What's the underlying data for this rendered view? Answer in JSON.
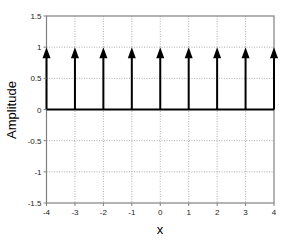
{
  "chart_data": {
    "type": "stem",
    "title": "",
    "xlabel": "x",
    "ylabel": "Amplitude",
    "xlim": [
      -4,
      4
    ],
    "ylim": [
      -1.5,
      1.5
    ],
    "x_ticks": [
      -4,
      -3,
      -2,
      -1,
      0,
      1,
      2,
      3,
      4
    ],
    "y_ticks": [
      -1.5,
      -1,
      -0.5,
      0,
      0.5,
      1,
      1.5
    ],
    "x_tick_labels": [
      "-4",
      "-3",
      "-2",
      "-1",
      "0",
      "1",
      "2",
      "3",
      "4"
    ],
    "y_tick_labels": [
      "-1.5",
      "-1",
      "-0.5",
      "0",
      "0.5",
      "1",
      "1.5"
    ],
    "grid": true,
    "grid_style": "dotted",
    "baseline": 0,
    "marker": "arrow-up",
    "series": [
      {
        "name": "impulse train",
        "x": [
          -4,
          -3,
          -2,
          -1,
          0,
          1,
          2,
          3,
          4
        ],
        "y": [
          1,
          1,
          1,
          1,
          1,
          1,
          1,
          1,
          1
        ]
      }
    ],
    "colors": {
      "stem": "#000000",
      "axis": "#808080",
      "grid": "#999999"
    }
  }
}
